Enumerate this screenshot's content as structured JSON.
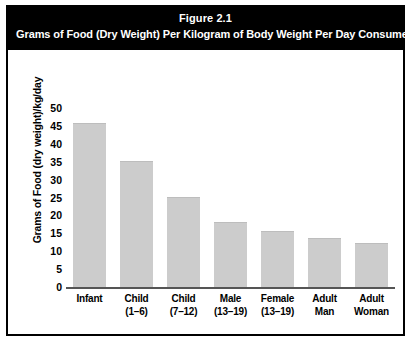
{
  "figure": {
    "number": "Figure 2.1",
    "caption": "Grams of Food (Dry Weight) Per Kilogram of Body Weight Per Day Consumed*"
  },
  "chart_data": {
    "type": "bar",
    "title": "Grams of Food (Dry Weight) Per Kilogram of Body Weight Per Day Consumed*",
    "xlabel": "",
    "ylabel": "Grams of Food (dry weight)/kg/day",
    "ylim": [
      0,
      50
    ],
    "yticks": [
      0,
      5,
      10,
      15,
      20,
      25,
      30,
      35,
      40,
      45,
      50
    ],
    "grid": false,
    "legend": null,
    "bar_color": "#cccccc",
    "categories": [
      {
        "line1": "Infant",
        "line2": ""
      },
      {
        "line1": "Child",
        "line2": "(1–6)"
      },
      {
        "line1": "Child",
        "line2": "(7–12)"
      },
      {
        "line1": "Male",
        "line2": "(13–19)"
      },
      {
        "line1": "Female",
        "line2": "(13–19)"
      },
      {
        "line1": "Adult",
        "line2": "Man"
      },
      {
        "line1": "Adult",
        "line2": "Woman"
      }
    ],
    "values": [
      45.5,
      35,
      25,
      18,
      15.5,
      13.5,
      12
    ]
  },
  "colors": {
    "header_background": "#000000",
    "header_text": "#ffffff",
    "bar_fill": "#cccccc",
    "axis": "#555555",
    "border": "#000000"
  }
}
